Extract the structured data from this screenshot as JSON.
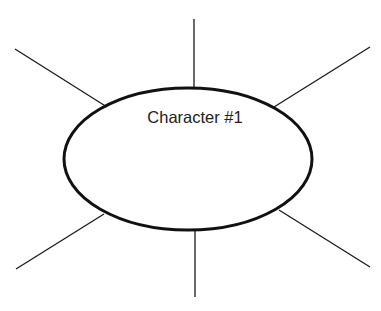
{
  "diagram": {
    "center_label": "Character #1",
    "stroke_color": "#1a1a1a",
    "ellipse": {
      "cx": 188,
      "cy": 159,
      "rx": 124,
      "ry": 71
    },
    "spokes": [
      {
        "name": "top",
        "x1": 194,
        "y1": 19,
        "x2": 194,
        "y2": 89
      },
      {
        "name": "upper-left",
        "x1": 15,
        "y1": 49,
        "x2": 107,
        "y2": 107
      },
      {
        "name": "upper-right",
        "x1": 370,
        "y1": 47,
        "x2": 274,
        "y2": 107
      },
      {
        "name": "lower-left",
        "x1": 104,
        "y1": 214,
        "x2": 16,
        "y2": 269
      },
      {
        "name": "bottom",
        "x1": 195,
        "y1": 231,
        "x2": 195,
        "y2": 297
      },
      {
        "name": "lower-right",
        "x1": 279,
        "y1": 210,
        "x2": 370,
        "y2": 267
      }
    ]
  }
}
